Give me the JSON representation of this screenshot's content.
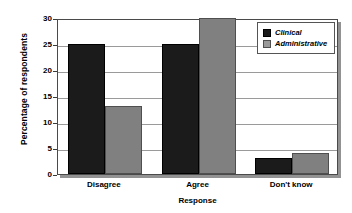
{
  "chart_data": {
    "type": "bar",
    "title": "",
    "xlabel": "Response",
    "ylabel": "Percentage of respondents",
    "categories": [
      "Disagree",
      "Agree",
      "Don't know"
    ],
    "series": [
      {
        "name": "Clinical",
        "color": "#1b1b1b",
        "values": [
          25,
          25,
          3
        ]
      },
      {
        "name": "Administrative",
        "color": "#808080",
        "values": [
          13,
          30,
          4
        ]
      }
    ],
    "ylim": [
      0,
      30
    ],
    "yticks": [
      0,
      5,
      10,
      15,
      20,
      25,
      30
    ],
    "ytick_labels": [
      "0",
      "5",
      "10",
      "15",
      "20",
      "25",
      "30"
    ],
    "grid": true,
    "grid_axis": "y",
    "legend_position": "top-right"
  },
  "legend": {
    "entries": [
      {
        "label": "Clinical",
        "swatch": "clinical-swatch"
      },
      {
        "label": "Administrative",
        "swatch": "administrative-swatch"
      }
    ]
  }
}
